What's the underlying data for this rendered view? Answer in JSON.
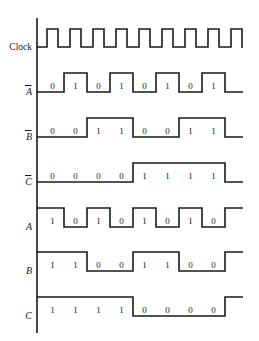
{
  "figure": {
    "line_color": "#1a1a1a",
    "background_color": "#ffffff"
  },
  "axis": {
    "x": 37,
    "top": 18,
    "bottom": 333
  },
  "timing": {
    "cell_width": 23,
    "cell_count": 8,
    "first_cell_x": 41,
    "clock_pulse_width": 11,
    "clock_pulse_offset": 6,
    "clock_pulse_count": 9,
    "tail_length": 18
  },
  "rows": [
    {
      "name": "clock",
      "label": "Clock",
      "label_overbar": false,
      "label_italic": false,
      "kind": "clock",
      "baseline_y": 47,
      "high_y": 29,
      "values": [],
      "show_values": false,
      "end_edge": "none"
    },
    {
      "name": "a-bar",
      "label": "A",
      "label_overbar": true,
      "label_italic": true,
      "kind": "level",
      "baseline_y": 92,
      "high_y": 73,
      "values": [
        0,
        1,
        0,
        1,
        0,
        1,
        0,
        1
      ],
      "show_values": true,
      "end_edge": "fall"
    },
    {
      "name": "b-bar",
      "label": "B",
      "label_overbar": true,
      "label_italic": true,
      "kind": "level",
      "baseline_y": 137,
      "high_y": 118,
      "values": [
        0,
        0,
        1,
        1,
        0,
        0,
        1,
        1
      ],
      "show_values": true,
      "end_edge": "fall"
    },
    {
      "name": "c-bar",
      "label": "C",
      "label_overbar": true,
      "label_italic": true,
      "kind": "level",
      "baseline_y": 182,
      "high_y": 163,
      "values": [
        0,
        0,
        0,
        0,
        1,
        1,
        1,
        1
      ],
      "show_values": true,
      "end_edge": "fall"
    },
    {
      "name": "a",
      "label": "A",
      "label_overbar": false,
      "label_italic": true,
      "kind": "level",
      "baseline_y": 227,
      "high_y": 208,
      "values": [
        1,
        0,
        1,
        0,
        1,
        0,
        1,
        0
      ],
      "show_values": true,
      "end_edge": "rise"
    },
    {
      "name": "b",
      "label": "B",
      "label_overbar": false,
      "label_italic": true,
      "kind": "level",
      "baseline_y": 271,
      "high_y": 252,
      "values": [
        1,
        1,
        0,
        0,
        1,
        1,
        0,
        0
      ],
      "show_values": true,
      "end_edge": "rise"
    },
    {
      "name": "c",
      "label": "C",
      "label_overbar": false,
      "label_italic": true,
      "kind": "level",
      "baseline_y": 316,
      "high_y": 297,
      "values": [
        1,
        1,
        1,
        1,
        0,
        0,
        0,
        0
      ],
      "show_values": true,
      "end_edge": "rise"
    }
  ],
  "chart_data": {
    "type": "line",
    "xlabel": "",
    "ylabel": "",
    "categories": [
      "t0",
      "t1",
      "t2",
      "t3",
      "t4",
      "t5",
      "t6",
      "t7"
    ],
    "series": [
      {
        "name": "Clock",
        "values": [
          1,
          1,
          1,
          1,
          1,
          1,
          1,
          1
        ]
      },
      {
        "name": "A-bar",
        "values": [
          0,
          1,
          0,
          1,
          0,
          1,
          0,
          1
        ]
      },
      {
        "name": "B-bar",
        "values": [
          0,
          0,
          1,
          1,
          0,
          0,
          1,
          1
        ]
      },
      {
        "name": "C-bar",
        "values": [
          0,
          0,
          0,
          0,
          1,
          1,
          1,
          1
        ]
      },
      {
        "name": "A",
        "values": [
          1,
          0,
          1,
          0,
          1,
          0,
          1,
          0
        ]
      },
      {
        "name": "B",
        "values": [
          1,
          1,
          0,
          0,
          1,
          1,
          0,
          0
        ]
      },
      {
        "name": "C",
        "values": [
          1,
          1,
          1,
          1,
          0,
          0,
          0,
          0
        ]
      }
    ],
    "ylim": [
      0,
      1
    ],
    "grid": false,
    "legend_position": "left-axis-labels"
  }
}
